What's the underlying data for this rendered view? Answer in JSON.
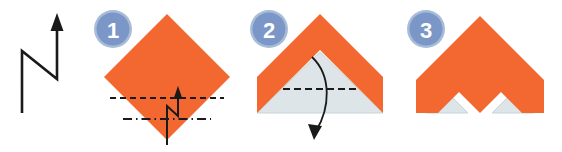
{
  "figure": {
    "background_color": "#ffffff",
    "width": 562,
    "height": 152
  },
  "palette": {
    "paper_front": "#f26830",
    "paper_back": "#dde5e8",
    "badge_fill": "#7a97c8",
    "badge_ring": "#a8bcd8",
    "badge_text": "#ffffff",
    "fold_line": "#1a1a1a",
    "arrow": "#1a1a1a",
    "edge_line": "#c9d3d8"
  },
  "legend": {
    "name": "pleat-fold-symbol",
    "description": "Zigzag pleat arrow pointing up",
    "arrow_direction": "up"
  },
  "steps": [
    {
      "number": "1",
      "badge_label": "1",
      "caption": "",
      "shape": "diamond",
      "paper_color": "#f26830",
      "fold_lines": [
        {
          "name": "valley-fold-line",
          "style": "dashed",
          "orientation": "horizontal"
        },
        {
          "name": "mountain-fold-line",
          "style": "dash-dot",
          "orientation": "horizontal"
        }
      ],
      "arrow": {
        "name": "pleat-arrow",
        "type": "zigzag",
        "direction": "up"
      }
    },
    {
      "number": "2",
      "badge_label": "2",
      "caption": "",
      "shape": "chevron",
      "paper_color": "#f26830",
      "inner_color": "#dde5e8",
      "fold_lines": [
        {
          "name": "valley-fold-line",
          "style": "dashed",
          "orientation": "horizontal"
        }
      ],
      "arrow": {
        "name": "fold-down-arrow",
        "type": "curved",
        "direction": "down"
      }
    },
    {
      "number": "3",
      "badge_label": "3",
      "caption": "",
      "shape": "zigzag-chevron",
      "paper_color": "#f26830",
      "inner_color": "#dde5e8",
      "fold_lines": [],
      "arrow": null
    }
  ]
}
